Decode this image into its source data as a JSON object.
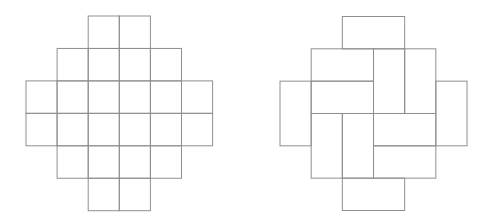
{
  "canvas": {
    "width": 494,
    "height": 223,
    "background": "#ffffff"
  },
  "style": {
    "line_color": "#8f8f8f",
    "line_width": 1,
    "fill": "none"
  },
  "figures": {
    "left": {
      "name": "aztec-diamond-unit-squares",
      "description": "Aztec diamond of order 3 drawn as 24 unit squares",
      "origin": {
        "x": 26,
        "y": 16
      },
      "unit": {
        "x": 31.1,
        "y": 32.45
      },
      "rows": [
        {
          "row": 0,
          "col_start": 2,
          "col_end": 3
        },
        {
          "row": 1,
          "col_start": 1,
          "col_end": 4
        },
        {
          "row": 2,
          "col_start": 0,
          "col_end": 5
        },
        {
          "row": 3,
          "col_start": 0,
          "col_end": 5
        },
        {
          "row": 4,
          "col_start": 1,
          "col_end": 4
        },
        {
          "row": 5,
          "col_start": 2,
          "col_end": 3
        }
      ]
    },
    "right": {
      "name": "aztec-diamond-domino-tiling",
      "description": "Same Aztec diamond tiled by 12 dominoes in a pinwheel pattern",
      "origin": {
        "x": 280,
        "y": 16.5
      },
      "unit": {
        "x": 31.17,
        "y": 32.33
      },
      "dominoes": [
        {
          "col": 2,
          "row": 0,
          "w": 2,
          "h": 1
        },
        {
          "col": 1,
          "row": 1,
          "w": 2,
          "h": 1
        },
        {
          "col": 3,
          "row": 1,
          "w": 1,
          "h": 2
        },
        {
          "col": 4,
          "row": 1,
          "w": 1,
          "h": 2
        },
        {
          "col": 0,
          "row": 2,
          "w": 1,
          "h": 2
        },
        {
          "col": 5,
          "row": 2,
          "w": 1,
          "h": 2
        },
        {
          "col": 1,
          "row": 2,
          "w": 2,
          "h": 1
        },
        {
          "col": 1,
          "row": 3,
          "w": 1,
          "h": 2
        },
        {
          "col": 2,
          "row": 3,
          "w": 1,
          "h": 2
        },
        {
          "col": 3,
          "row": 3,
          "w": 2,
          "h": 1
        },
        {
          "col": 3,
          "row": 4,
          "w": 2,
          "h": 1
        },
        {
          "col": 2,
          "row": 5,
          "w": 2,
          "h": 1
        }
      ]
    }
  }
}
